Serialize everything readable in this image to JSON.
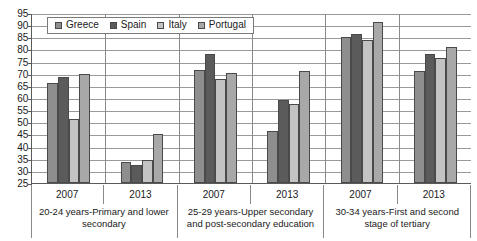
{
  "chart_data": {
    "type": "bar",
    "title": "",
    "xlabel": "",
    "ylabel": "",
    "ylim": [
      25,
      95
    ],
    "ytick_step": 5,
    "yticks": [
      95,
      90,
      85,
      80,
      75,
      70,
      65,
      60,
      55,
      50,
      45,
      40,
      35,
      30,
      25
    ],
    "grid": true,
    "legend_position": "top-left-inside",
    "legend": [
      "Greece",
      "Spain",
      "Italy",
      "Portugal"
    ],
    "series_colors": [
      "#8e8e8e",
      "#5b5b5b",
      "#c3c3c3",
      "#a8a8a8"
    ],
    "categories": [
      "2007",
      "2013",
      "2007",
      "2013",
      "2007",
      "2013"
    ],
    "group_captions": [
      "20-24 years-Primary and lower secondary",
      "25-29 years-Upper secondary and post-secondary education",
      "30-34 years-First and second stage of tertiary"
    ],
    "group_caption_lines": [
      [
        "20-24 years-Primary and lower",
        "secondary"
      ],
      [
        "25-29 years-Upper secondary",
        "and post-secondary education"
      ],
      [
        "30-34 years-First and second",
        "stage of tertiary"
      ]
    ],
    "series": [
      {
        "name": "Greece",
        "values": [
          66.0,
          33.5,
          71.5,
          46.5,
          85.0,
          71.0
        ]
      },
      {
        "name": "Spain",
        "values": [
          68.5,
          32.5,
          78.0,
          59.0,
          86.5,
          78.0
        ]
      },
      {
        "name": "Italy",
        "values": [
          51.5,
          34.5,
          68.0,
          57.5,
          84.0,
          76.5
        ]
      },
      {
        "name": "Portugal",
        "values": [
          70.0,
          45.0,
          70.5,
          71.0,
          91.5,
          81.0
        ]
      }
    ]
  }
}
